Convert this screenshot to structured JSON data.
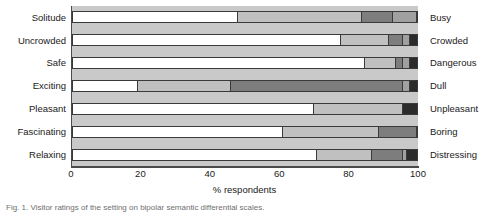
{
  "chart_data": {
    "type": "bar",
    "subtype": "stacked-horizontal-bar",
    "title": "",
    "xlabel": "% respondents",
    "ylabel": "",
    "xlim": [
      0,
      100
    ],
    "xticks": [
      0,
      20,
      40,
      60,
      80,
      100
    ],
    "grid": false,
    "legend_position": "none",
    "orientation": "horizontal",
    "stacked": true,
    "categories": [
      "Solitude",
      "Uncrowded",
      "Safe",
      "Exciting",
      "Pleasant",
      "Fascinating",
      "Relaxing"
    ],
    "categories_right": [
      "Busy",
      "Crowded",
      "Dangerous",
      "Dull",
      "Unpleasant",
      "Boring",
      "Distressing"
    ],
    "series": [
      {
        "name": "Strongly left pole",
        "color": "#ffffff",
        "values": [
          48,
          78,
          85,
          19,
          70,
          61,
          71
        ]
      },
      {
        "name": "Somewhat left pole",
        "color": "#c0c0c0",
        "values": [
          36,
          14,
          9,
          27,
          26,
          28,
          16
        ]
      },
      {
        "name": "Neutral",
        "color": "#7d7d7d",
        "values": [
          9,
          4,
          2,
          50,
          0,
          11,
          9
        ]
      },
      {
        "name": "Somewhat right pole",
        "color": "#a0a0a0",
        "values": [
          7,
          2,
          2,
          2,
          0,
          0,
          1
        ]
      },
      {
        "name": "Strongly right pole",
        "color": "#2b2b2b",
        "values": [
          0,
          2,
          2,
          2,
          4,
          0,
          3
        ]
      }
    ]
  },
  "caption": {
    "text": "Fig. 1. Visitor ratings of the setting on bipolar semantic differential scales."
  }
}
